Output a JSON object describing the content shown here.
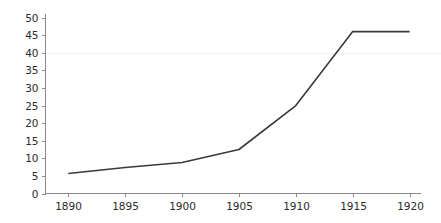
{
  "chart_data": {
    "type": "line",
    "title": "",
    "subtitle": "",
    "xlabel": "",
    "ylabel": "",
    "x": [
      1890,
      1895,
      1900,
      1905,
      1910,
      1915,
      1920
    ],
    "values": [
      5.7,
      7.4,
      8.8,
      12.5,
      25.0,
      46.0,
      46.0
    ],
    "series": [
      {
        "name": "",
        "values": [
          5.7,
          7.4,
          8.8,
          12.5,
          25.0,
          46.0,
          46.0
        ],
        "color": "#3a3a3a"
      }
    ],
    "xlim": [
      1888,
      1921
    ],
    "ylim": [
      0,
      51
    ],
    "x_ticks": [
      1890,
      1895,
      1900,
      1905,
      1910,
      1915,
      1920
    ],
    "x_tick_labels": [
      "1890",
      "1895",
      "1900",
      "1905",
      "1910",
      "1915",
      "1920"
    ],
    "y_ticks": [
      0,
      5,
      10,
      15,
      20,
      25,
      30,
      35,
      40,
      45,
      50
    ],
    "y_tick_labels": [
      "0",
      "5",
      "10",
      "15",
      "20",
      "25",
      "30",
      "35",
      "40",
      "45",
      "50"
    ],
    "grid": "horizontal-faint-at-40",
    "gridlines_y": [
      40
    ],
    "legend": "none",
    "colors": {
      "line": "#3a3a3a",
      "axis": "#8a8a8a",
      "text": "#2b2b2b",
      "grid": "#f2f2f2",
      "background": "#ffffff"
    }
  }
}
